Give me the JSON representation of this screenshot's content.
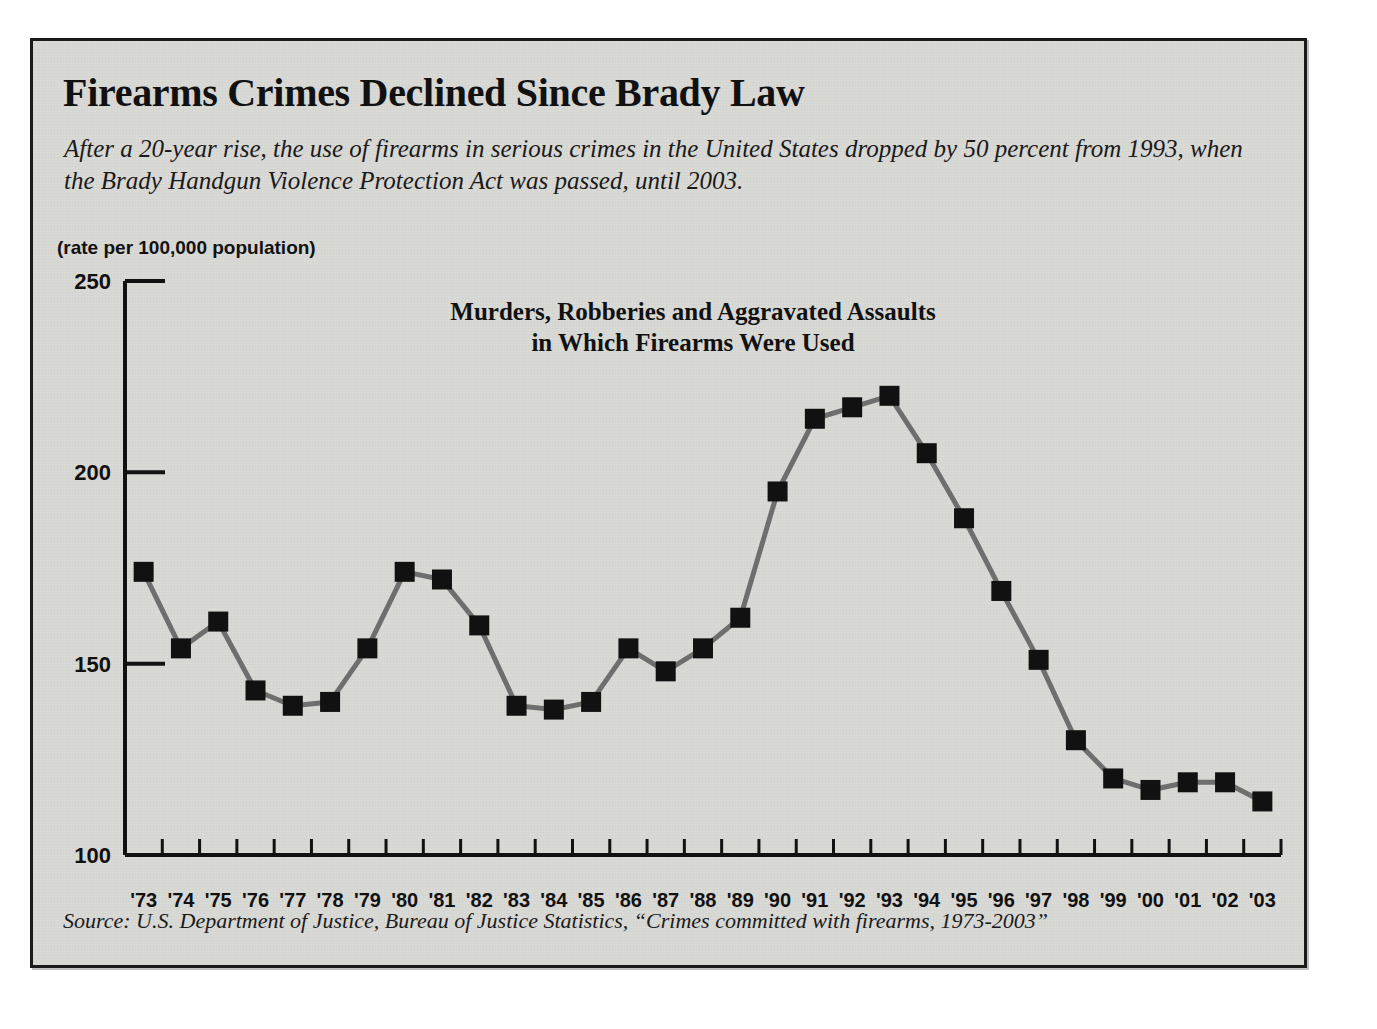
{
  "headline": "Firearms Crimes Declined Since Brady Law",
  "deck": "After a 20-year rise, the use of firearms in serious crimes in the United States dropped by 50 percent from 1993, when the Brady Handgun Violence Protection Act was passed, until 2003.",
  "units_label": "(rate per 100,000 population)",
  "source": "Source: U.S. Department of Justice, Bureau of Justice Statistics, “Crimes committed with firearms, 1973-2003”",
  "colors": {
    "panel_background": "#d9d9d6",
    "panel_border": "#1a1a1a",
    "text": "#111111",
    "line": "#6e6e6e",
    "marker": "#111111",
    "axis": "#111111"
  },
  "chart_data": {
    "type": "line",
    "title": "Murders, Robberies and Aggravated Assaults in Which Firearms Were Used",
    "title_line1": "Murders, Robberies and Aggravated Assaults",
    "title_line2": "in Which Firearms Were Used",
    "xlabel": "",
    "ylabel": "(rate per 100,000 population)",
    "ylim": [
      100,
      250
    ],
    "yticks": [
      100,
      150,
      200,
      250
    ],
    "ytick_labels": [
      "100",
      "150",
      "200",
      "250"
    ],
    "grid": false,
    "legend": "none",
    "marker": "square",
    "categories": [
      "'73",
      "'74",
      "'75",
      "'76",
      "'77",
      "'78",
      "'79",
      "'80",
      "'81",
      "'82",
      "'83",
      "'84",
      "'85",
      "'86",
      "'87",
      "'88",
      "'89",
      "'90",
      "'91",
      "'92",
      "'93",
      "'94",
      "'95",
      "'96",
      "'97",
      "'98",
      "'99",
      "'00",
      "'01",
      "'02",
      "'03"
    ],
    "x": [
      1973,
      1974,
      1975,
      1976,
      1977,
      1978,
      1979,
      1980,
      1981,
      1982,
      1983,
      1984,
      1985,
      1986,
      1987,
      1988,
      1989,
      1990,
      1991,
      1992,
      1993,
      1994,
      1995,
      1996,
      1997,
      1998,
      1999,
      2000,
      2001,
      2002,
      2003
    ],
    "values": [
      174,
      154,
      161,
      143,
      139,
      140,
      154,
      174,
      172,
      160,
      139,
      138,
      140,
      154,
      148,
      154,
      162,
      195,
      214,
      217,
      220,
      205,
      188,
      169,
      151,
      130,
      120,
      117,
      119,
      119,
      114
    ],
    "annotations": []
  }
}
